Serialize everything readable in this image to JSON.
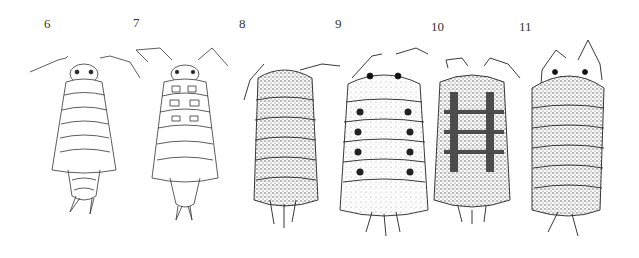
{
  "figure": {
    "specimens": [
      {
        "label": "6",
        "style": "outline, unshaded",
        "x": 46,
        "y": 17
      },
      {
        "label": "7",
        "style": "outline with pigment patch outlines",
        "x": 135,
        "y": 16
      },
      {
        "label": "8",
        "style": "densely stippled, mottled",
        "x": 240,
        "y": 17
      },
      {
        "label": "9",
        "style": "lightly stippled with dark paired spots",
        "x": 336,
        "y": 17
      },
      {
        "label": "10",
        "style": "stippled with dark checkered blotches",
        "x": 432,
        "y": 20
      },
      {
        "label": "11",
        "style": "densely stippled, uniform",
        "x": 520,
        "y": 20
      }
    ]
  },
  "colors": {
    "background": "#ffffff",
    "ink": "#2a2a2a",
    "stipple": "#555555"
  }
}
